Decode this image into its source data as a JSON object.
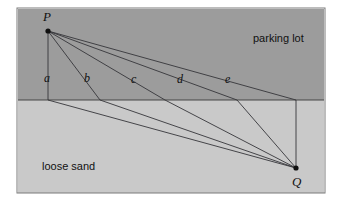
{
  "figure": {
    "frame": {
      "x": 17,
      "y": 8,
      "width": 308,
      "height": 185,
      "border_color": "#7a7a7a"
    },
    "regions": [
      {
        "name": "parking lot",
        "label": "parking lot",
        "label_x": 253,
        "label_y": 42,
        "fill": "#9c9c9c",
        "x": 18,
        "y": 9,
        "width": 306,
        "height": 91
      },
      {
        "name": "loose sand",
        "label": "loose sand",
        "label_x": 42,
        "label_y": 170,
        "fill": "#c9c9c9",
        "x": 18,
        "y": 100,
        "width": 306,
        "height": 93
      }
    ],
    "boundary": {
      "x1": 18,
      "y1": 100,
      "x2": 324,
      "y2": 100,
      "color": "#3a3a3a"
    },
    "points": [
      {
        "id": "P",
        "label": "P",
        "x": 48,
        "y": 31,
        "label_x": 43,
        "label_y": 21
      },
      {
        "id": "Q",
        "label": "Q",
        "x": 296,
        "y": 168,
        "label_x": 292,
        "label_y": 186
      }
    ],
    "paths": [
      {
        "id": "a",
        "label": "a",
        "label_x": 44,
        "label_y": 82,
        "bx": 48,
        "by": 100
      },
      {
        "id": "b",
        "label": "b",
        "label_x": 84,
        "label_y": 82,
        "bx": 100,
        "by": 100
      },
      {
        "id": "c",
        "label": "c",
        "label_x": 131,
        "label_y": 83,
        "bx": 165,
        "by": 100
      },
      {
        "id": "d",
        "label": "d",
        "label_x": 177,
        "label_y": 83,
        "bx": 237,
        "by": 100
      },
      {
        "id": "e",
        "label": "e",
        "label_x": 225,
        "label_y": 83,
        "bx": 296,
        "by": 100
      }
    ],
    "line_color": "#35353a",
    "line_width": 0.9,
    "dot_color": "#101010",
    "dot_radius": 2.6
  }
}
